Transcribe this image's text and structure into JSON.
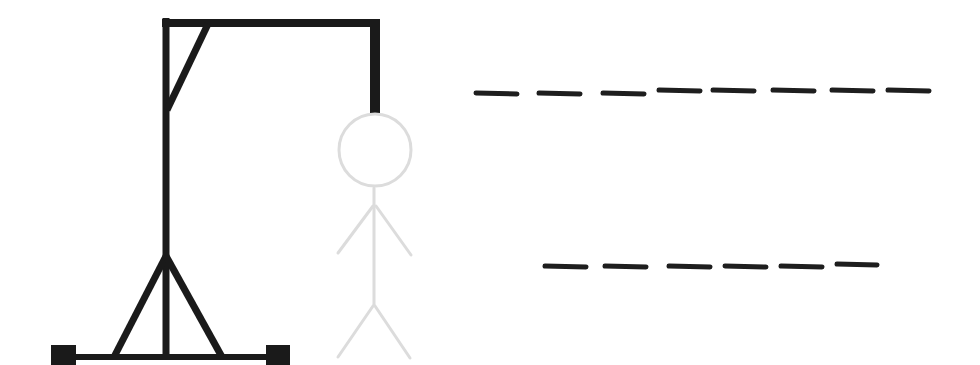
{
  "game": {
    "title": "Hangman",
    "wrong_guesses": 0,
    "max_wrong_guesses": 6
  },
  "colors": {
    "background": "#ffffff",
    "gallows": "#1a1a1a",
    "stickman_hidden": "#dcdcdc",
    "blank": "#1e1e1e"
  },
  "gallows": {
    "label": "gallows"
  },
  "stickman": {
    "label": "stickman",
    "state": "hidden",
    "parts": [
      "head",
      "body",
      "left-arm",
      "right-arm",
      "left-leg",
      "right-leg"
    ]
  },
  "puzzle": {
    "words": [
      {
        "length": 8,
        "letters": [
          "",
          "",
          "",
          "",
          "",
          "",
          "",
          ""
        ]
      },
      {
        "length": 6,
        "letters": [
          "",
          "",
          "",
          "",
          "",
          ""
        ]
      }
    ]
  }
}
